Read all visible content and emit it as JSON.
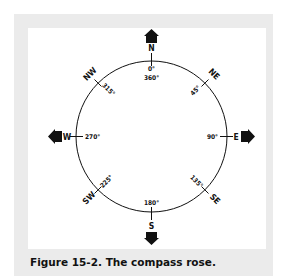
{
  "figure": {
    "caption": "Figure 15-2. The compass rose.",
    "directions": {
      "n": "N",
      "ne": "NE",
      "e": "E",
      "se": "SE",
      "s": "S",
      "sw": "SW",
      "w": "W",
      "nw": "NW"
    },
    "degrees": {
      "n0": "0°",
      "n360": "360°",
      "ne": "45°",
      "e": "90°",
      "se": "135°",
      "s": "180°",
      "sw": "225°",
      "w": "270°",
      "nw": "315°"
    },
    "colors": {
      "frame": "#ebebeb",
      "ink": "#111111",
      "panel": "#ffffff"
    }
  }
}
